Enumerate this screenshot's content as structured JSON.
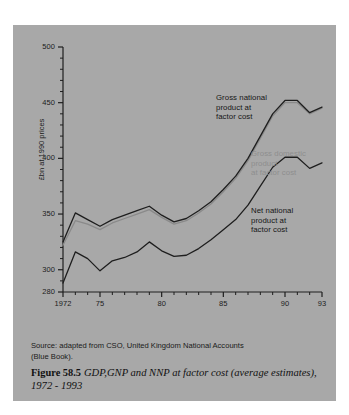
{
  "figure": {
    "source_text": "Source:  adapted from CSO, United Kingdom National Accounts\n(Blue Book).",
    "number_label": "Figure 58.5",
    "title": "GDP,GNP and NNP at factor cost (average estimates), 1972 - 1993"
  },
  "axes": {
    "y_title": "£bn at 1990 prices",
    "y_ticks": [
      "500",
      "450",
      "400",
      "350",
      "300",
      "280"
    ],
    "x_ticks": [
      "1972",
      "75",
      "80",
      "85",
      "90",
      "93"
    ]
  },
  "annotations": {
    "gnp": "Gross national\nproduct at\nfactor cost",
    "gdp": "Gross domestic\nproduct\nat factor cost",
    "nnp": "Net national\nproduct at\nfactor cost"
  },
  "colors": {
    "panel_background": "#a8a8a8",
    "page_background": "#ffffff",
    "gnp_line": "#1e1e1e",
    "gdp_line": "#8a8a8a",
    "nnp_line": "#1e1e1e",
    "axis": "#1e1e1e"
  },
  "chart_data": {
    "type": "line",
    "title": "GDP,GNP and NNP at factor cost (average estimates), 1972 - 1993",
    "xlabel": "",
    "ylabel": "£bn at 1990 prices",
    "xlim": [
      1972,
      1993
    ],
    "ylim": [
      280,
      500
    ],
    "ytick_values": [
      500,
      450,
      400,
      350,
      300,
      280
    ],
    "ytick_minor_step": 10,
    "xtick_values": [
      1972,
      1975,
      1980,
      1985,
      1990,
      1993
    ],
    "xtick_minor_step": 1,
    "grid": false,
    "legend": "inline-annotations",
    "x": [
      1972,
      1973,
      1974,
      1975,
      1976,
      1977,
      1978,
      1979,
      1980,
      1981,
      1982,
      1983,
      1984,
      1985,
      1986,
      1987,
      1988,
      1989,
      1990,
      1991,
      1992,
      1993
    ],
    "series": [
      {
        "name": "Gross national product at factor cost",
        "color": "#1e1e1e",
        "values": [
          325,
          351,
          345,
          339,
          345,
          349,
          353,
          357,
          349,
          343,
          346,
          353,
          361,
          372,
          384,
          400,
          420,
          440,
          452,
          452,
          441,
          446
        ]
      },
      {
        "name": "Gross domestic product at factor cost",
        "color": "#8a8a8a",
        "values": [
          322,
          344,
          341,
          336,
          342,
          346,
          350,
          354,
          347,
          341,
          344,
          351,
          359,
          370,
          382,
          398,
          418,
          438,
          450,
          450,
          440,
          445
        ]
      },
      {
        "name": "Net national product at factor cost",
        "color": "#1e1e1e",
        "values": [
          288,
          316,
          310,
          299,
          308,
          311,
          316,
          325,
          317,
          312,
          313,
          319,
          327,
          336,
          345,
          358,
          375,
          392,
          401,
          401,
          391,
          396
        ]
      }
    ]
  }
}
